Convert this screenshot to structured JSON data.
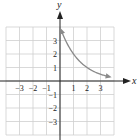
{
  "chart_data": {
    "type": "line",
    "title": "",
    "xlabel": "x",
    "ylabel": "y",
    "xlim": [
      -4,
      4
    ],
    "ylim": [
      -4,
      4
    ],
    "grid": true,
    "x_ticks": [
      -3,
      -2,
      -1,
      1,
      2,
      3
    ],
    "y_ticks": [
      3,
      2,
      1,
      -1,
      -2,
      -3
    ],
    "x_tick_labels": [
      "−3",
      "−2",
      "−1",
      "1",
      "2",
      "3"
    ],
    "y_tick_labels": [
      "3",
      "2",
      "1",
      "−1",
      "−2",
      "−3"
    ],
    "series": [
      {
        "name": "curve",
        "formula": "y = 4(1/2)^x",
        "color": "#8a8a8a",
        "arrows": "both ends",
        "x": [
          0.05,
          0.5,
          1,
          1.5,
          2,
          2.5,
          3,
          3.5,
          3.85
        ],
        "y": [
          3.86,
          2.83,
          2.0,
          1.41,
          1.0,
          0.71,
          0.5,
          0.35,
          0.28
        ]
      }
    ]
  },
  "labels": {
    "x_axis": "x",
    "y_axis": "y"
  },
  "colors": {
    "grid": "#cfcfcf",
    "axis": "#222222",
    "curve": "#8a8a8a"
  }
}
